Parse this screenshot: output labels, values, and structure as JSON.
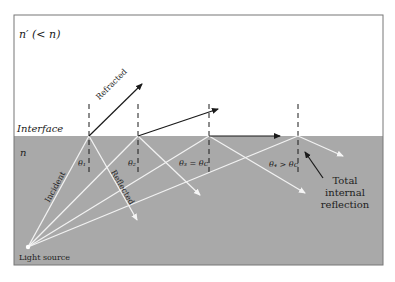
{
  "colors": {
    "upper_medium": "#ffffff",
    "lower_medium": "#a9a9a9",
    "border": "#777777",
    "incident_rays": "#f2f2f2",
    "refracted_rays": "#1a1a1a",
    "normals": "#1a1a1a",
    "text": "#222222"
  },
  "labels": {
    "upper_medium": "n′ (< n)",
    "interface": "Interface",
    "lower_medium": "n",
    "refracted": "Refracted",
    "incident": "Incident",
    "reflected": "Reflected",
    "theta1": "θ₁",
    "theta2": "θ₂",
    "theta3": "θ₃ = θc",
    "theta4": "θ₄ > θc",
    "tir_line1": "Total",
    "tir_line2": "internal",
    "tir_line3": "reflection",
    "source": "Light source"
  },
  "geometry": {
    "frame": {
      "x": 14,
      "y": 15,
      "w": 369,
      "h": 250
    },
    "interface_y": 136,
    "source": {
      "x": 28,
      "y": 247
    },
    "hit_points_x": [
      89,
      138,
      209,
      298
    ],
    "refracted_ends": [
      [
        142,
        84
      ],
      [
        218,
        109
      ],
      [
        280,
        136
      ]
    ],
    "reflected_ends": [
      [
        137,
        220
      ],
      [
        200,
        195
      ],
      [
        305,
        193
      ],
      [
        343,
        156
      ]
    ]
  }
}
